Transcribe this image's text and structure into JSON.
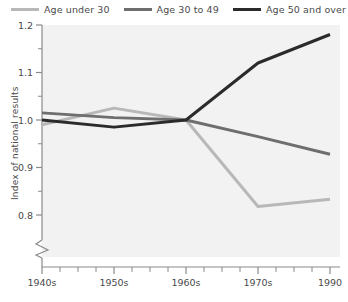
{
  "chart_data": {
    "type": "line",
    "title": "",
    "xlabel": "",
    "ylabel": "Index of national results",
    "x": [
      "1940s",
      "1950s",
      "1960s",
      "1970s",
      "1990"
    ],
    "xtick_labels": [
      "1940s",
      "1950s",
      "1960s",
      "1970s",
      "1990"
    ],
    "ytick_labels": [
      "0.8",
      "0.9",
      "1.0",
      "1.1",
      "1.2"
    ],
    "ylim": [
      0.77,
      1.2
    ],
    "yticks": [
      0.8,
      0.9,
      1.0,
      1.1,
      1.2
    ],
    "y_minor_ticks": [
      0.85,
      0.95,
      1.05,
      1.15
    ],
    "axis_break": true,
    "grid": false,
    "legend_position": "top-right",
    "series": [
      {
        "name": "Age under 30",
        "color": "#b8b8b8",
        "values": [
          0.99,
          1.025,
          1.0,
          0.818,
          0.833
        ]
      },
      {
        "name": "Age 30 to 49",
        "color": "#6e6e6e",
        "values": [
          1.015,
          1.005,
          1.0,
          0.965,
          0.928
        ]
      },
      {
        "name": "Age 50 and over",
        "color": "#2b2b2b",
        "values": [
          1.0,
          0.985,
          1.0,
          1.12,
          1.18
        ]
      }
    ]
  },
  "legend": {
    "items": [
      {
        "label": "Age under 30",
        "color": "#b8b8b8"
      },
      {
        "label": "Age 30 to 49",
        "color": "#6e6e6e"
      },
      {
        "label": "Age 50 and over",
        "color": "#2b2b2b"
      }
    ]
  },
  "axes": {
    "y_title": "Index of national results",
    "y_labels": [
      "1.2",
      "1.1",
      "1.0",
      "0.9",
      "0.8"
    ],
    "x_labels": [
      "1940s",
      "1950s",
      "1960s",
      "1970s",
      "1990"
    ]
  }
}
